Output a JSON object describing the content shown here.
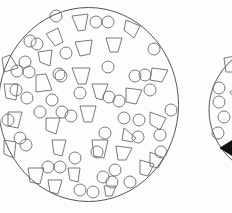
{
  "figure": {
    "panel_a": {
      "boundary": {
        "cx": 88.5,
        "cy": 104.5,
        "rx": 90,
        "ry": 97
      },
      "circles": [
        [
          56,
          16,
          6
        ],
        [
          30,
          41,
          6
        ],
        [
          37,
          44,
          6
        ],
        [
          96,
          22,
          6
        ],
        [
          108,
          22,
          6
        ],
        [
          154,
          49,
          6
        ],
        [
          66,
          53,
          6
        ],
        [
          25,
          62,
          6
        ],
        [
          17,
          71,
          6
        ],
        [
          108,
          67,
          6
        ],
        [
          59,
          74,
          6
        ],
        [
          29,
          72,
          6
        ],
        [
          16,
          90,
          6
        ],
        [
          61,
          76,
          6
        ],
        [
          80,
          93,
          6
        ],
        [
          145,
          75,
          6
        ],
        [
          150,
          90,
          6
        ],
        [
          135,
          76,
          6
        ],
        [
          171,
          110,
          6
        ],
        [
          109,
          97,
          6
        ],
        [
          119,
          101,
          6
        ],
        [
          27,
          98,
          6
        ],
        [
          52,
          100,
          6
        ],
        [
          40,
          112,
          6
        ],
        [
          71,
          116,
          6
        ],
        [
          20,
          138,
          6
        ],
        [
          8,
          120,
          6
        ],
        [
          124,
          118,
          6
        ],
        [
          139,
          120,
          6
        ],
        [
          105,
          133,
          6
        ],
        [
          138,
          137,
          6
        ],
        [
          26,
          145,
          6
        ],
        [
          97,
          152,
          6
        ],
        [
          160,
          135,
          6
        ],
        [
          75,
          158,
          6
        ],
        [
          48,
          167,
          6
        ],
        [
          60,
          167,
          6
        ],
        [
          115,
          170,
          6
        ],
        [
          80,
          190,
          6
        ],
        [
          93,
          192,
          6
        ],
        [
          130,
          182,
          6
        ],
        [
          112,
          182,
          6
        ],
        [
          103,
          177,
          6
        ],
        [
          62,
          112,
          6
        ],
        [
          161,
          152,
          6
        ]
      ],
      "polygons": [
        [
          [
            72,
            16
          ],
          [
            88,
            14
          ],
          [
            85,
            30
          ],
          [
            78,
            31
          ]
        ],
        [
          [
            46,
            34
          ],
          [
            58,
            28
          ],
          [
            63,
            42
          ],
          [
            55,
            46
          ]
        ],
        [
          [
            126,
            20
          ],
          [
            140,
            26
          ],
          [
            134,
            38
          ],
          [
            124,
            30
          ]
        ],
        [
          [
            38,
            52
          ],
          [
            52,
            50
          ],
          [
            50,
            66
          ],
          [
            40,
            62
          ]
        ],
        [
          [
            75,
            42
          ],
          [
            92,
            40
          ],
          [
            90,
            54
          ],
          [
            80,
            56
          ]
        ],
        [
          [
            106,
            38
          ],
          [
            122,
            38
          ],
          [
            118,
            52
          ],
          [
            110,
            52
          ]
        ],
        [
          [
            2,
            58
          ],
          [
            10,
            55
          ],
          [
            18,
            68
          ],
          [
            4,
            72
          ]
        ],
        [
          [
            152,
            68
          ],
          [
            168,
            70
          ],
          [
            162,
            82
          ],
          [
            150,
            80
          ]
        ],
        [
          [
            36,
            75
          ],
          [
            46,
            74
          ],
          [
            52,
            90
          ],
          [
            36,
            92
          ]
        ],
        [
          [
            72,
            68
          ],
          [
            90,
            68
          ],
          [
            86,
            84
          ],
          [
            78,
            84
          ]
        ],
        [
          [
            4,
            84
          ],
          [
            18,
            84
          ],
          [
            16,
            100
          ],
          [
            6,
            98
          ]
        ],
        [
          [
            92,
            84
          ],
          [
            108,
            84
          ],
          [
            102,
            100
          ],
          [
            96,
            98
          ]
        ],
        [
          [
            126,
            88
          ],
          [
            142,
            90
          ],
          [
            136,
            104
          ],
          [
            126,
            102
          ]
        ],
        [
          [
            8,
            112
          ],
          [
            22,
            112
          ],
          [
            18,
            128
          ],
          [
            8,
            126
          ]
        ],
        [
          [
            46,
            118
          ],
          [
            60,
            118
          ],
          [
            56,
            134
          ],
          [
            46,
            130
          ]
        ],
        [
          [
            80,
            106
          ],
          [
            96,
            106
          ],
          [
            92,
            122
          ],
          [
            84,
            122
          ]
        ],
        [
          [
            124,
            128
          ],
          [
            136,
            138
          ],
          [
            132,
            142
          ],
          [
            122,
            140
          ]
        ],
        [
          [
            150,
            112
          ],
          [
            166,
            118
          ],
          [
            160,
            130
          ],
          [
            150,
            124
          ]
        ],
        [
          [
            52,
            140
          ],
          [
            66,
            140
          ],
          [
            62,
            156
          ],
          [
            54,
            154
          ]
        ],
        [
          [
            92,
            140
          ],
          [
            108,
            140
          ],
          [
            104,
            158
          ],
          [
            94,
            156
          ]
        ],
        [
          [
            116,
            146
          ],
          [
            132,
            148
          ],
          [
            126,
            160
          ],
          [
            118,
            160
          ]
        ],
        [
          [
            4,
            140
          ],
          [
            16,
            142
          ],
          [
            14,
            158
          ],
          [
            4,
            154
          ]
        ],
        [
          [
            28,
            168
          ],
          [
            44,
            168
          ],
          [
            40,
            184
          ],
          [
            30,
            182
          ]
        ],
        [
          [
            48,
            180
          ],
          [
            62,
            180
          ],
          [
            58,
            194
          ],
          [
            50,
            192
          ]
        ],
        [
          [
            68,
            168
          ],
          [
            80,
            168
          ],
          [
            78,
            182
          ],
          [
            70,
            180
          ]
        ],
        [
          [
            140,
            160
          ],
          [
            154,
            164
          ],
          [
            148,
            176
          ],
          [
            140,
            174
          ]
        ],
        [
          [
            150,
            152
          ],
          [
            164,
            158
          ],
          [
            158,
            168
          ],
          [
            150,
            166
          ]
        ],
        [
          [
            104,
            186
          ],
          [
            116,
            186
          ],
          [
            112,
            196
          ],
          [
            106,
            196
          ]
        ]
      ]
    },
    "panel_b": {
      "boundary": {
        "cx": 290,
        "cy": 110,
        "rx": 81,
        "ry": 72
      },
      "circles": [
        [
          219,
          88,
          6
        ],
        [
          219,
          102,
          6
        ],
        [
          224,
          117,
          6
        ],
        [
          218,
          133,
          6
        ]
      ],
      "polygons": [
        [
          [
            224,
            58
          ],
          [
            236,
            56
          ],
          [
            236,
            72
          ],
          [
            226,
            72
          ]
        ],
        [
          [
            230,
            92
          ],
          [
            236,
            88
          ],
          [
            236,
            100
          ]
        ]
      ],
      "solid_polygons": [
        [
          [
            220,
            148
          ],
          [
            236,
            138
          ],
          [
            236,
            158
          ]
        ]
      ]
    }
  }
}
